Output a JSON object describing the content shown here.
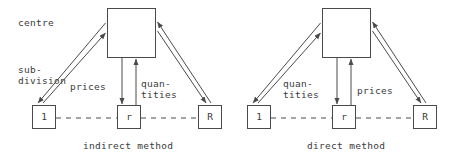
{
  "figure": {
    "stroke_color": "#4a4a4a",
    "text_color": "#3a3a3a",
    "background": "#ffffff"
  },
  "annotations": {
    "centre_label": "centre",
    "subdivision_label_line1": "sub-",
    "subdivision_label_line2": "division"
  },
  "panels": [
    {
      "id": "indirect",
      "caption": "indirect method",
      "centre_box_label": "",
      "nodes": [
        {
          "id": "left",
          "label": "1"
        },
        {
          "id": "middle",
          "label": "r"
        },
        {
          "id": "right",
          "label": "R"
        }
      ],
      "vertical_edges": [
        {
          "id": "down-edge",
          "label_line1": "prices",
          "label_line2": "",
          "direction": "down"
        },
        {
          "id": "up-edge",
          "label_line1": "quan-",
          "label_line2": "tities",
          "direction": "up"
        }
      ]
    },
    {
      "id": "direct",
      "caption": "direct method",
      "centre_box_label": "",
      "nodes": [
        {
          "id": "left",
          "label": "1"
        },
        {
          "id": "middle",
          "label": "r"
        },
        {
          "id": "right",
          "label": "R"
        }
      ],
      "vertical_edges": [
        {
          "id": "down-edge",
          "label_line1": "quan-",
          "label_line2": "tities",
          "direction": "down"
        },
        {
          "id": "up-edge",
          "label_line1": "prices",
          "label_line2": "",
          "direction": "up"
        }
      ]
    }
  ]
}
